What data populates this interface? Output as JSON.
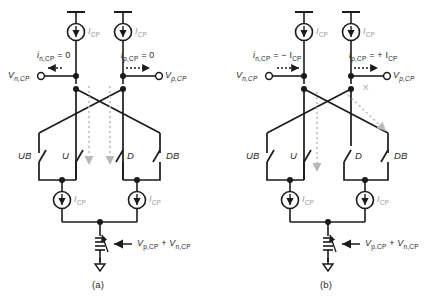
{
  "figure": {
    "panels": [
      {
        "id": "a",
        "caption": "(a)",
        "left_terminal": "V",
        "left_terminal_sub": "n,CP",
        "right_terminal": "V",
        "right_terminal_sub": "p,CP",
        "left_current_label": "i",
        "left_current_sub": "n,CP",
        "left_current_value": "= 0",
        "right_current_label": "i",
        "right_current_sub": "p,CP",
        "right_current_value": "= 0",
        "left_arrow_direction": "left",
        "right_arrow_direction": "right",
        "top_source_left": "I",
        "top_source_left_sub": "CP",
        "top_source_right": "I",
        "top_source_right_sub": "CP",
        "bottom_source_left": "I",
        "bottom_source_left_sub": "CP",
        "bottom_source_right": "I",
        "bottom_source_right_sub": "CP",
        "switches": [
          "UB",
          "U",
          "D",
          "DB"
        ],
        "switch_states": [
          "open",
          "open",
          "open",
          "open"
        ],
        "resistor_label_1": "V",
        "resistor_label_1_sub": "p,CP",
        "resistor_plus": "+",
        "resistor_label_2": "V",
        "resistor_label_2_sub": "n,CP",
        "marker": ""
      },
      {
        "id": "b",
        "caption": "(b)",
        "left_terminal": "V",
        "left_terminal_sub": "n,CP",
        "right_terminal": "V",
        "right_terminal_sub": "p,CP",
        "left_current_label": "i",
        "left_current_sub": "n,CP",
        "left_current_value": "= − I",
        "left_current_value_sub": "CP",
        "right_current_label": "i",
        "right_current_sub": "p,CP",
        "right_current_value": "= + I",
        "right_current_value_sub": "CP",
        "left_arrow_direction": "right",
        "right_arrow_direction": "right",
        "top_source_left": "I",
        "top_source_left_sub": "CP",
        "top_source_right": "I",
        "top_source_right_sub": "CP",
        "bottom_source_left": "I",
        "bottom_source_left_sub": "CP",
        "bottom_source_right": "I",
        "bottom_source_right_sub": "CP",
        "switches": [
          "UB",
          "U",
          "D",
          "DB"
        ],
        "switch_states": [
          "open",
          "open",
          "open",
          "open"
        ],
        "resistor_label_1": "V",
        "resistor_label_1_sub": "p,CP",
        "resistor_plus": "+",
        "resistor_label_2": "V",
        "resistor_label_2_sub": "n,CP",
        "marker": "X"
      }
    ],
    "colors": {
      "wire": "#1b1b1b",
      "dotted_gray": "#b9b9b9",
      "label_gray": "#9a9a9a",
      "text": "#1b1b1b",
      "background": "#ffffff"
    }
  }
}
